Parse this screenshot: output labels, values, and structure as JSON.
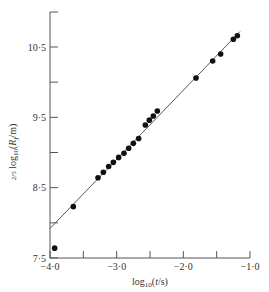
{
  "chart_data": {
    "type": "scatter",
    "title": "",
    "xlabel": "log10(t/s)",
    "ylabel": "2/5 log10(Rf/m)",
    "xlim": [
      -4.0,
      -1.0
    ],
    "ylim": [
      7.5,
      11.0
    ],
    "x_ticks": [
      -4.0,
      -3.5,
      -3.0,
      -2.5,
      -2.0,
      -1.5,
      -1.0
    ],
    "x_tick_labels": [
      "-4·0",
      "",
      "-3·0",
      "",
      "-2·0",
      "",
      "-1·0"
    ],
    "y_ticks": [
      7.5,
      8.0,
      8.5,
      9.0,
      9.5,
      10.0,
      10.5
    ],
    "y_tick_labels": [
      "7·5",
      "",
      "8·5",
      "",
      "9·5",
      "",
      "10·5"
    ],
    "grid": false,
    "legend": null,
    "series": [
      {
        "name": "measurements",
        "marker": "filled-circle",
        "x": [
          -3.93,
          -3.65,
          -3.28,
          -3.2,
          -3.12,
          -3.05,
          -2.97,
          -2.89,
          -2.82,
          -2.75,
          -2.67,
          -2.57,
          -2.51,
          -2.45,
          -2.39,
          -1.81,
          -1.56,
          -1.44,
          -1.25,
          -1.19
        ],
        "y": [
          7.64,
          8.23,
          8.64,
          8.72,
          8.8,
          8.86,
          8.93,
          8.99,
          9.06,
          9.13,
          9.2,
          9.39,
          9.46,
          9.52,
          9.59,
          10.06,
          10.3,
          10.4,
          10.61,
          10.66
        ]
      },
      {
        "name": "fit line",
        "type": "line",
        "x": [
          -4.0,
          -1.15
        ],
        "y": [
          7.92,
          10.72
        ]
      }
    ]
  },
  "labels": {
    "x_axis": "log10(t/s)",
    "y_axis_prefix": "2/5",
    "y_axis": "log10(Rf/m)"
  }
}
